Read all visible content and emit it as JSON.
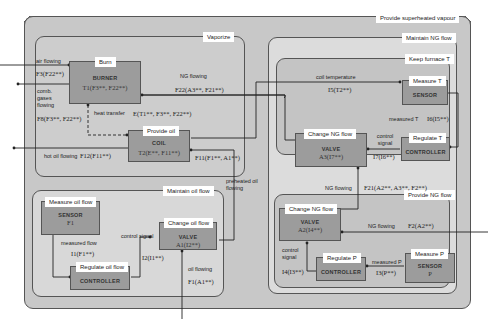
{
  "regions": {
    "provide_superheated_vapour": "Provide superheated vapour",
    "vaporize": "Vaporize",
    "maintain_ng_flow": "Maintain NG flow",
    "keep_furnace_t": "Keep furnace T",
    "provide_ng_flow": "Provide NG flow",
    "maintain_oil_flow": "Maintain oil flow"
  },
  "components": {
    "burner": {
      "function": "Burn",
      "name": "BURNER",
      "expr": "T1(F3**, F22**)"
    },
    "coil": {
      "function": "Provide oil",
      "name": "COIL",
      "expr": "T2(E**, F11**)"
    },
    "sensor_t": {
      "function": "Measure T",
      "name": "SENSOR",
      "expr": ""
    },
    "controller_t": {
      "function": "Regulate T",
      "name": "CONTROLLER",
      "expr": ""
    },
    "valve_a3": {
      "function": "Change NG flow",
      "name": "VALVE",
      "expr": "A3(I7**)"
    },
    "valve_a2": {
      "function": "Change NG flow",
      "name": "VALVE",
      "expr": "A2(I4**)"
    },
    "controller_p": {
      "function": "Regulate P",
      "name": "CONTROLLER",
      "expr": ""
    },
    "sensor_p": {
      "function": "Measure P",
      "name": "SENSOR",
      "expr": "P"
    },
    "sensor_f1": {
      "function": "Measure oil flow",
      "name": "SENSOR",
      "expr": "F1"
    },
    "controller_oil": {
      "function": "Regulate oil flow",
      "name": "CONTROLLER",
      "expr": ""
    },
    "valve_a1": {
      "function": "Change oil flow",
      "name": "VALVE",
      "expr": "A1(I2**)"
    }
  },
  "flows": {
    "air_flowing": {
      "label": "air flowing",
      "expr": "F3(F22**)"
    },
    "comb_gases": {
      "label": "comb. gases flowing",
      "expr": "F8(F3**, F22**)"
    },
    "ng_flowing_f22": {
      "label": "NG flowing",
      "expr": "F22(A3**, F21**)"
    },
    "heat_transfer": {
      "label": "heat transfer",
      "expr": "E(T1**, F3**, F22**)"
    },
    "hot_oil": {
      "label": "hot oil flowing",
      "expr": "F12(F11**)"
    },
    "preheated_oil": {
      "label": "preheated oil flowing",
      "expr": "F11(F1**, A1**)"
    },
    "coil_temp": {
      "label": "coil temperature",
      "expr": "I5(T2**)"
    },
    "measured_t": {
      "label": "measured T",
      "expr": "I6(I5**)"
    },
    "control_signal_t": {
      "label": "control signal",
      "expr": "I7(I6**)"
    },
    "ng_flowing_f21": {
      "label": "NG flowing",
      "expr": "F21(A2**, A3**, F2**)"
    },
    "ng_flowing_f2": {
      "label": "NG flowing",
      "expr": "F2(A2**)"
    },
    "control_signal_p": {
      "label": "control signal",
      "expr": "I4(I3**)"
    },
    "measured_p": {
      "label": "measured P",
      "expr": "I3(P**)"
    },
    "measured_flow": {
      "label": "measured flow",
      "expr": "I1(F1**)"
    },
    "control_signal_oil": {
      "label": "control signal",
      "expr": "I2(I1**)"
    },
    "oil_flowing": {
      "label": "oil flowing",
      "expr": "F1(A1**)"
    }
  }
}
